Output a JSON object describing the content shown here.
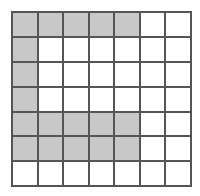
{
  "figure": {
    "type": "grid",
    "rows": 7,
    "columns": 7,
    "cell_width_px": 25.5,
    "cell_height_px": 24.9,
    "origin_x_px": 11,
    "origin_y_px": 11,
    "colors": {
      "background": "#ffffff",
      "gridline": "#555555",
      "filled_cell": "#c8c8c8",
      "empty_cell": "#ffffff"
    },
    "gridline_width_px": 2,
    "filled_cell_count": 16,
    "empty_cell_count": 33,
    "legend": {
      "filled_state": "shaded",
      "empty_state": "unshaded"
    },
    "grid_cells": [
      [
        "shaded",
        "shaded",
        "shaded",
        "shaded",
        "shaded",
        "unshaded",
        "unshaded"
      ],
      [
        "shaded",
        "unshaded",
        "unshaded",
        "unshaded",
        "unshaded",
        "unshaded",
        "unshaded"
      ],
      [
        "shaded",
        "unshaded",
        "unshaded",
        "unshaded",
        "unshaded",
        "unshaded",
        "unshaded"
      ],
      [
        "shaded",
        "unshaded",
        "unshaded",
        "unshaded",
        "unshaded",
        "unshaded",
        "unshaded"
      ],
      [
        "shaded",
        "shaded",
        "shaded",
        "shaded",
        "shaded",
        "unshaded",
        "unshaded"
      ],
      [
        "shaded",
        "shaded",
        "shaded",
        "shaded",
        "shaded",
        "unshaded",
        "unshaded"
      ],
      [
        "unshaded",
        "unshaded",
        "unshaded",
        "unshaded",
        "unshaded",
        "unshaded",
        "unshaded"
      ]
    ],
    "row_filled_counts": [
      5,
      1,
      1,
      1,
      5,
      5,
      0
    ],
    "column_filled_counts": [
      6,
      3,
      3,
      3,
      3,
      0,
      0
    ]
  }
}
